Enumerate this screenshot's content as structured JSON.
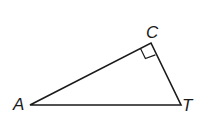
{
  "diagram": {
    "type": "right-triangle",
    "vertices": [
      {
        "label": "A",
        "x": 30,
        "y": 105
      },
      {
        "label": "C",
        "x": 151,
        "y": 43
      },
      {
        "label": "T",
        "x": 181,
        "y": 105
      }
    ],
    "right_angle_at": "C",
    "stroke_color": "#1a1a1a",
    "background": "#ffffff"
  },
  "labels": {
    "a": "A",
    "c": "C",
    "t": "T"
  }
}
